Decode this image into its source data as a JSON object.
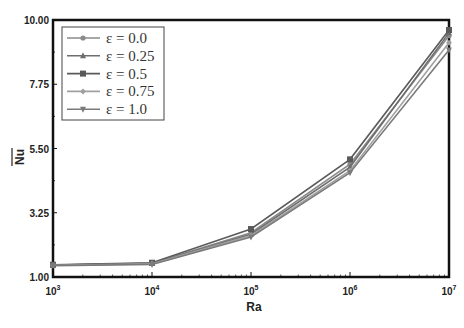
{
  "chart_data": {
    "type": "line",
    "title": "",
    "xlabel": "Ra",
    "ylabel": "Nu (overbar, average Nusselt number)",
    "xscale": "log",
    "x": [
      1000,
      10000,
      100000,
      1000000,
      10000000
    ],
    "x_tick_labels": [
      {
        "base": "10",
        "exp": "3"
      },
      {
        "base": "10",
        "exp": "4"
      },
      {
        "base": "10",
        "exp": "5"
      },
      {
        "base": "10",
        "exp": "6"
      },
      {
        "base": "10",
        "exp": "7"
      }
    ],
    "y_ticks": [
      "1.00",
      "3.25",
      "5.50",
      "7.75",
      "10.00"
    ],
    "ylim": [
      1.0,
      10.0
    ],
    "grid": false,
    "legend_position": "upper-left",
    "series": [
      {
        "name": "ε = 0.0",
        "marker": "circle",
        "values": [
          1.42,
          1.48,
          2.55,
          4.95,
          9.45
        ]
      },
      {
        "name": "ε = 0.25",
        "marker": "triangle-up",
        "values": [
          1.42,
          1.47,
          2.5,
          4.85,
          9.55
        ]
      },
      {
        "name": "ε = 0.5",
        "marker": "square",
        "values": [
          1.43,
          1.5,
          2.68,
          5.12,
          9.65
        ]
      },
      {
        "name": "ε = 0.75",
        "marker": "diamond",
        "values": [
          1.41,
          1.46,
          2.45,
          4.72,
          9.2
        ]
      },
      {
        "name": "ε = 1.0",
        "marker": "triangle-down",
        "values": [
          1.4,
          1.44,
          2.4,
          4.65,
          8.95
        ]
      }
    ]
  },
  "axes": {
    "xlabel": "Ra",
    "ylabel": "Nu"
  }
}
